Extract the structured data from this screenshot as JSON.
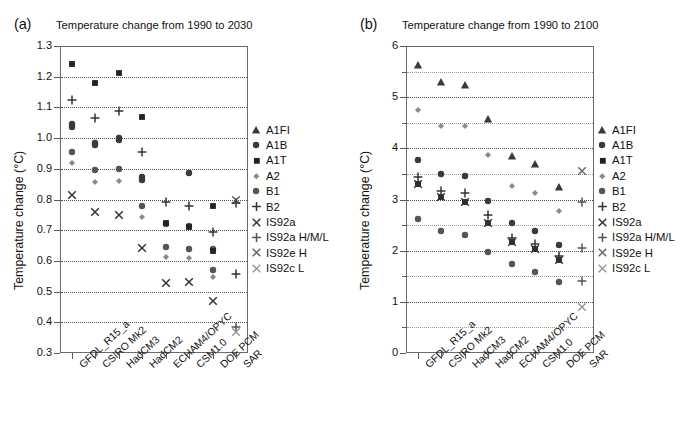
{
  "figure": {
    "panels": [
      {
        "letter": "(a)",
        "title": "Temperature change from 1990 to 2030",
        "ylabel": "Temperature change (°C)"
      },
      {
        "letter": "(b)",
        "title": "Temperature change from 1990 to 2100",
        "ylabel": "Temperature change (°C)"
      }
    ]
  },
  "legend": {
    "entries": [
      {
        "label": "A1FI",
        "marker": "triangle-up",
        "color": "#3a3a3a"
      },
      {
        "label": "A1B",
        "marker": "circle",
        "color": "#3a3a3a"
      },
      {
        "label": "A1T",
        "marker": "square",
        "color": "#222222"
      },
      {
        "label": "A2",
        "marker": "diamond",
        "color": "#8a8a8a"
      },
      {
        "label": "B1",
        "marker": "circle",
        "color": "#555555"
      },
      {
        "label": "B2",
        "marker": "plus",
        "color": "#333333"
      },
      {
        "label": "IS92a",
        "marker": "cross",
        "color": "#333333"
      },
      {
        "label": "IS92a H/M/L",
        "marker": "plus",
        "color": "#555555"
      },
      {
        "label": "IS92e H",
        "marker": "cross",
        "color": "#666666"
      },
      {
        "label": "IS92c L",
        "marker": "cross",
        "color": "#999999"
      }
    ]
  },
  "chart_data": [
    {
      "type": "scatter",
      "panel": "a",
      "title": "Temperature change from 1990 to 2030",
      "xlabel": "",
      "ylabel": "Temperature change (°C)",
      "ylim": [
        0.3,
        1.3
      ],
      "yticks": [
        0.3,
        0.4,
        0.5,
        0.6,
        0.7,
        0.8,
        0.9,
        1.0,
        1.1,
        1.2,
        1.3
      ],
      "ytick_labels": [
        "0.3",
        "0.4",
        "0.5",
        "0.6",
        "0.7",
        "0.8",
        "0.9",
        "1.0",
        "1.1",
        "1.2",
        "1.3"
      ],
      "grid": true,
      "legend_position": "right",
      "categories": [
        "GFDL_R15_a",
        "CSIRO Mk2",
        "HadCM3",
        "HadCM2",
        "ECHAM4/OPYC",
        "CSM1.0",
        "DOE PCM",
        "SAR"
      ],
      "series": [
        {
          "name": "A1FI",
          "marker": "triangle-up",
          "values": [
            null,
            null,
            null,
            null,
            null,
            null,
            null,
            null
          ]
        },
        {
          "name": "A1B",
          "marker": "circle",
          "values": [
            1.045,
            0.985,
            1.0,
            0.865,
            null,
            null,
            null,
            null
          ]
        },
        {
          "name": "A1T",
          "marker": "square",
          "values": [
            1.24,
            1.18,
            1.213,
            1.068,
            null,
            null,
            0.778,
            null
          ]
        },
        {
          "name": "A2",
          "marker": "diamond",
          "values": [
            0.92,
            0.858,
            0.86,
            0.743,
            0.613,
            0.608,
            0.548,
            null
          ]
        },
        {
          "name": "B1",
          "marker": "circle",
          "values": [
            0.955,
            0.897,
            0.9,
            0.78,
            0.645,
            0.639,
            0.57,
            null
          ]
        },
        {
          "name": "B2",
          "marker": "plus",
          "values": [
            1.125,
            1.066,
            1.088,
            0.955,
            0.792,
            0.78,
            0.695,
            0.556
          ]
        },
        {
          "name": "IS92a",
          "marker": "cross",
          "values": [
            0.815,
            0.76,
            0.751,
            0.643,
            0.527,
            0.531,
            0.471,
            null
          ]
        },
        {
          "name": "IS92a H/M/L",
          "marker": "plus",
          "values": [
            null,
            null,
            null,
            null,
            null,
            null,
            null,
            0.385
          ]
        },
        {
          "name": "IS92e H",
          "marker": "cross",
          "values": [
            null,
            null,
            null,
            null,
            null,
            null,
            null,
            0.8
          ]
        },
        {
          "name": "IS92c L",
          "marker": "cross",
          "values": [
            null,
            null,
            null,
            null,
            null,
            null,
            null,
            0.368
          ]
        }
      ],
      "extra_points": [
        {
          "series": "A1B",
          "category_index": 0,
          "value": 1.035
        },
        {
          "series": "A1B",
          "category_index": 1,
          "value": 0.978
        },
        {
          "series": "A1B",
          "category_index": 2,
          "value": 0.995
        },
        {
          "series": "A1B",
          "category_index": 3,
          "value": 0.872
        },
        {
          "series": "B1",
          "category_index": 4,
          "value": 0.719
        },
        {
          "series": "B1",
          "category_index": 5,
          "value": 0.714
        },
        {
          "series": "B1",
          "category_index": 6,
          "value": 0.64
        },
        {
          "series": "A1T",
          "category_index": 4,
          "value": 0.722
        },
        {
          "series": "A1T",
          "category_index": 5,
          "value": 0.71
        },
        {
          "series": "A1T",
          "category_index": 6,
          "value": 0.632
        },
        {
          "series": "A1B",
          "category_index": 5,
          "value": 0.886
        },
        {
          "series": "B2",
          "category_index": 7,
          "value": 0.787
        }
      ]
    },
    {
      "type": "scatter",
      "panel": "b",
      "title": "Temperature change from 1990 to 2100",
      "xlabel": "",
      "ylabel": "Temperature change (°C)",
      "ylim": [
        0,
        6
      ],
      "yticks": [
        0,
        1,
        2,
        3,
        4,
        5,
        6
      ],
      "ytick_labels": [
        "0",
        "1",
        "2",
        "3",
        "4",
        "5",
        "6"
      ],
      "minor_yticks": [
        0.5,
        1.5,
        2.5,
        3.5,
        4.5,
        5.5
      ],
      "grid": true,
      "legend_position": "right",
      "categories": [
        "GFDL_R15_a",
        "CSIRO Mk2",
        "HadCM3",
        "HadCM2",
        "ECHAM4/OPYC",
        "CSM1.0",
        "DOE PCM",
        "SAR"
      ],
      "series": [
        {
          "name": "A1FI",
          "marker": "triangle-up",
          "values": [
            5.62,
            5.3,
            5.24,
            4.57,
            3.85,
            3.69,
            3.25,
            null
          ]
        },
        {
          "name": "A1B",
          "marker": "circle",
          "values": [
            3.78,
            3.5,
            3.46,
            2.97,
            2.55,
            2.39,
            2.11,
            null
          ]
        },
        {
          "name": "A1T",
          "marker": "square",
          "values": [
            3.3,
            3.04,
            2.96,
            2.55,
            2.17,
            2.04,
            1.81,
            null
          ]
        },
        {
          "name": "A2",
          "marker": "diamond",
          "values": [
            4.75,
            4.43,
            4.44,
            3.87,
            3.26,
            3.12,
            2.78,
            null
          ]
        },
        {
          "name": "B1",
          "marker": "circle",
          "values": [
            2.61,
            2.39,
            2.31,
            1.98,
            1.73,
            1.59,
            1.39,
            null
          ]
        },
        {
          "name": "B2",
          "marker": "plus",
          "values": [
            3.43,
            3.16,
            3.13,
            2.7,
            2.25,
            2.13,
            1.9,
            null
          ]
        },
        {
          "name": "IS92a",
          "marker": "cross",
          "values": [
            3.3,
            3.04,
            2.96,
            2.55,
            2.17,
            2.04,
            1.81,
            null
          ]
        },
        {
          "name": "IS92a H/M/L",
          "marker": "plus",
          "values": [
            null,
            null,
            null,
            null,
            null,
            null,
            null,
            2.96
          ]
        },
        {
          "name": "IS92e H",
          "marker": "cross",
          "values": [
            null,
            null,
            null,
            null,
            null,
            null,
            null,
            3.55
          ]
        },
        {
          "name": "IS92c L",
          "marker": "cross",
          "values": [
            null,
            null,
            null,
            null,
            null,
            null,
            null,
            0.9
          ]
        }
      ],
      "extra_points": [
        {
          "series": "IS92a H/M/L",
          "category_index": 7,
          "value": 2.05
        },
        {
          "series": "IS92a H/M/L",
          "category_index": 7,
          "value": 1.4
        }
      ]
    }
  ]
}
